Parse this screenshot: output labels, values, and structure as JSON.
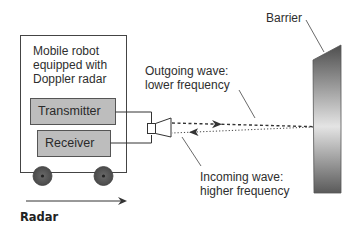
{
  "diagram": {
    "robot": {
      "title_lines": [
        "Mobile robot",
        "equipped with",
        "Doppler radar"
      ],
      "components": [
        "Transmitter",
        "Receiver"
      ]
    },
    "barrier_label": "Barrier",
    "outgoing": {
      "line1": "Outgoing wave:",
      "line2": "lower frequency"
    },
    "incoming": {
      "line1": "Incoming wave:",
      "line2": "higher frequency"
    },
    "caption": "Radar",
    "colors": {
      "component_fill": "#bdbdbd",
      "wheel": "#555555",
      "barrier_dark": "#555555",
      "barrier_light": "#e6e6e6",
      "line": "#333333"
    }
  }
}
